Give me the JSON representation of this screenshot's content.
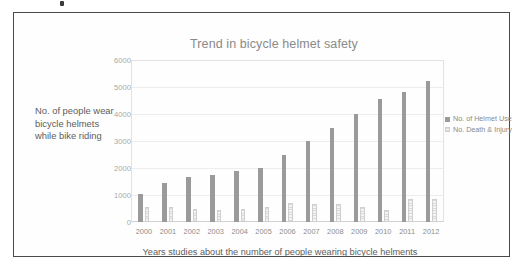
{
  "chart_data": {
    "type": "bar",
    "title": "Trend in bicycle helmet safety",
    "xlabel": "Years studies about the number of people wearing bicycle helments",
    "ylabel": "No. of people wear bicycle helmets while bike riding",
    "categories": [
      "2000",
      "2001",
      "2002",
      "2003",
      "2004",
      "2005",
      "2006",
      "2007",
      "2008",
      "2009",
      "2010",
      "2011",
      "2012"
    ],
    "series": [
      {
        "name": "No. of Helmet Use",
        "color": "#9a9a9a",
        "values": [
          1050,
          1450,
          1650,
          1750,
          1880,
          2000,
          2500,
          3000,
          3500,
          4000,
          4550,
          4800,
          5230
        ]
      },
      {
        "name": "No. Death & Injury",
        "color": "#dcdcdc",
        "values": [
          540,
          560,
          490,
          430,
          490,
          570,
          710,
          660,
          660,
          560,
          440,
          860,
          870
        ]
      }
    ],
    "yticks": [
      0,
      1000,
      2000,
      3000,
      4000,
      5000,
      6000
    ],
    "ylim": [
      0,
      6000
    ],
    "grid": true,
    "legend_position": "right"
  }
}
